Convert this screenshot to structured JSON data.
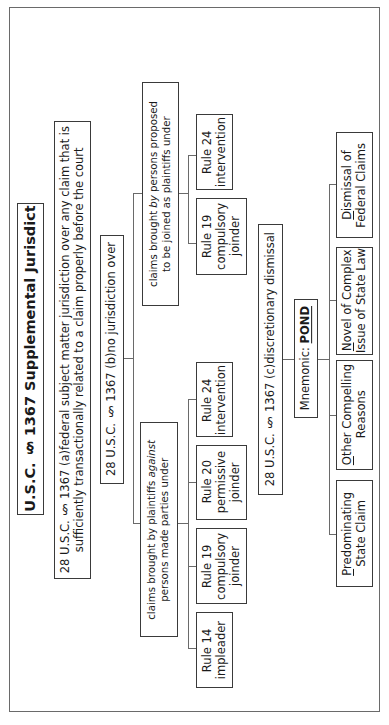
{
  "title": "28 U.S.C. § 1367 Supplemental Jurisdiction",
  "section_a": {
    "cite": "28 U.S.C. § 1367 (a)",
    "line1": "federal subject matter jurisdiction over any claim that is",
    "line2": "sufficiently transactionally related to a claim properly before the court"
  },
  "section_b": {
    "cite": "28 U.S.C. § 1367 (b)",
    "label": "no jurisdiction over"
  },
  "branch_against": {
    "line1_pre": "claims brought by plaintiffs ",
    "line1_italic": "against",
    "line2": "persons made parties under",
    "rules": [
      {
        "l1": "Rule 14",
        "l2": "impleader"
      },
      {
        "l1": "Rule 19",
        "l2": "compulsory",
        "l3": "joinder"
      },
      {
        "l1": "Rule 20",
        "l2": "permissive",
        "l3": "joinder"
      },
      {
        "l1": "Rule 24",
        "l2": "intervention"
      }
    ]
  },
  "branch_by": {
    "line1_pre": "claims brought ",
    "line1_italic": "by",
    "line1_post": " persons proposed",
    "line2": "to be joined as plaintiffs under",
    "rules": [
      {
        "l1": "Rule 19",
        "l2": "compulsory",
        "l3": "joinder"
      },
      {
        "l1": "Rule 24",
        "l2": "intervention"
      }
    ]
  },
  "section_c": {
    "cite": "28 U.S.C. § 1367 (c)",
    "label": "discretionary dismissal"
  },
  "mnemonic": {
    "label": "Mnemonic: ",
    "word": "POND"
  },
  "pond_items": [
    {
      "first": "P",
      "rest1": "redominating",
      "line2": "State Claim"
    },
    {
      "first": "O",
      "rest1": "ther Compelling",
      "line2": "Reasons"
    },
    {
      "first": "N",
      "rest1": "ovel of Complex",
      "line2": "Issue of State Law"
    },
    {
      "first": "D",
      "rest1": "ismissal of",
      "line2": "Federal Claims"
    }
  ]
}
